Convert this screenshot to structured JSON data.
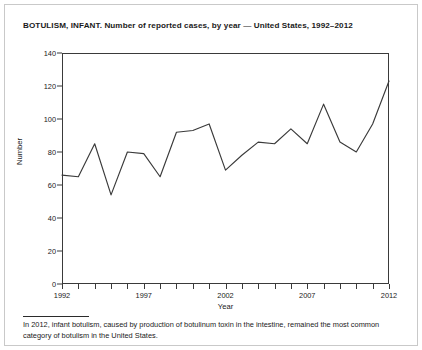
{
  "chart_title": "BOTULISM, INFANT. Number of reported cases, by year — United States, 1992–2012",
  "footnote": "In 2012, infant botulism, caused by production of botulinum toxin in the intestine, remained the most common category of botulism in the United States.",
  "axes": {
    "y_title": "Number",
    "x_title": "Year",
    "y_ticks": [
      "0",
      "20",
      "40",
      "60",
      "80",
      "100",
      "120",
      "140"
    ],
    "x_ticks": [
      "1992",
      "1997",
      "2002",
      "2007",
      "2012"
    ]
  },
  "colors": {
    "line": "#3a3a3a",
    "axis": "#3a3a3a",
    "text": "#1a1a1a",
    "outer_border": "#c9c9c9",
    "background": "#ffffff"
  },
  "chart_data": {
    "type": "line",
    "title": "BOTULISM, INFANT. Number of reported cases, by year — United States, 1992–2012",
    "xlabel": "Year",
    "ylabel": "Number",
    "xlim": [
      1992,
      2012
    ],
    "ylim": [
      0,
      140
    ],
    "ytick_values": [
      0,
      20,
      40,
      60,
      80,
      100,
      120,
      140
    ],
    "xtick_values": [
      1992,
      1997,
      2002,
      2007,
      2012
    ],
    "grid": false,
    "legend": false,
    "x": [
      1992,
      1993,
      1994,
      1995,
      1996,
      1997,
      1998,
      1999,
      2000,
      2001,
      2002,
      2003,
      2004,
      2005,
      2006,
      2007,
      2008,
      2009,
      2010,
      2011,
      2012
    ],
    "values": [
      66,
      65,
      85,
      54,
      80,
      79,
      65,
      92,
      93,
      97,
      69,
      78,
      86,
      85,
      94,
      85,
      109,
      86,
      80,
      97,
      123
    ]
  }
}
